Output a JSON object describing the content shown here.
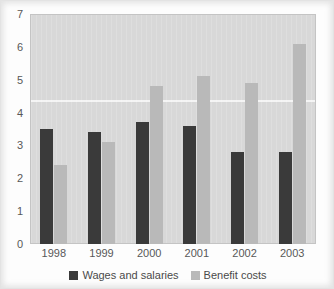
{
  "chart_data": {
    "type": "bar",
    "title": "",
    "xlabel": "",
    "ylabel": "",
    "categories": [
      "1998",
      "1999",
      "2000",
      "2001",
      "2002",
      "2003"
    ],
    "series": [
      {
        "name": "Wages and salaries",
        "color": "#3a3a3a",
        "values": [
          3.5,
          3.4,
          3.7,
          3.6,
          2.8,
          2.8
        ]
      },
      {
        "name": "Benefit costs",
        "color": "#b9b9b9",
        "values": [
          2.4,
          3.1,
          4.8,
          5.1,
          4.9,
          6.1
        ]
      }
    ],
    "ylim": [
      0,
      7
    ],
    "yticks": [
      0,
      1,
      2,
      3,
      4,
      5,
      6,
      7
    ],
    "ytick_labels": [
      "0",
      "1",
      "2",
      "3",
      "4",
      "5",
      "6",
      "7"
    ],
    "grid": false,
    "legend_position": "bottom",
    "plot_background": "#d8d8d8"
  }
}
